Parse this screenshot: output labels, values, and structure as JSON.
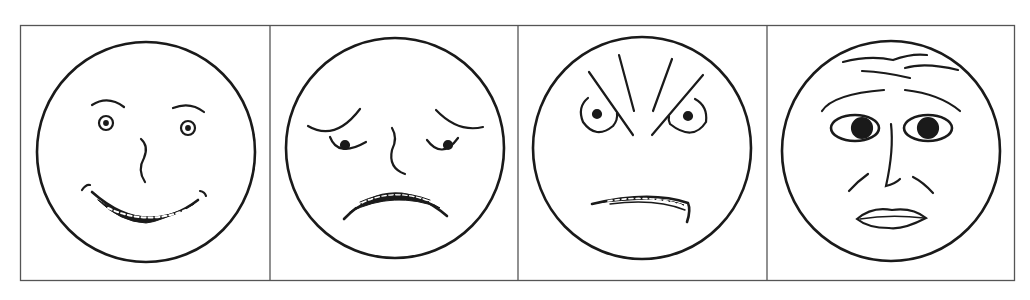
{
  "figure": {
    "stroke_color": "#1a1a1a",
    "border_color": "#555555",
    "background": "#ffffff",
    "panels": [
      {
        "emotion": "happy",
        "icon": "happy-face-icon"
      },
      {
        "emotion": "sad",
        "icon": "sad-face-icon"
      },
      {
        "emotion": "angry",
        "icon": "angry-face-icon"
      },
      {
        "emotion": "fearful",
        "icon": "fearful-face-icon"
      }
    ]
  }
}
